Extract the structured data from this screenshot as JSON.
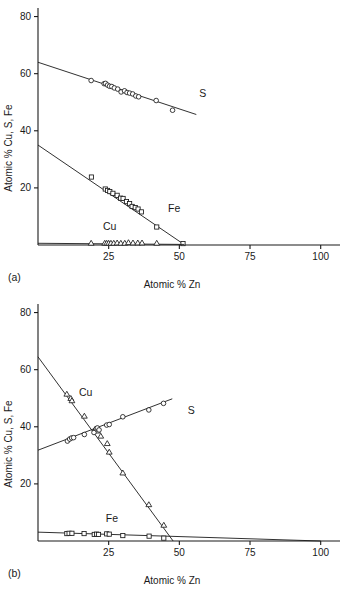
{
  "figure": {
    "panels": [
      {
        "id": "a",
        "panel_label": "(a)",
        "xlabel": "Atomic % Zn",
        "ylabel": "Atomic % Cu, S, Fe"
      },
      {
        "id": "b",
        "panel_label": "(b)",
        "xlabel": "Atomic % Zn",
        "ylabel": "Atomic % Cu, S, Fe"
      }
    ]
  },
  "chart_data": [
    {
      "type": "scatter",
      "panel": "(a)",
      "title": "",
      "xlabel": "Atomic % Zn",
      "ylabel": "Atomic % Cu, S, Fe",
      "xlim": [
        0,
        104
      ],
      "ylim": [
        0,
        83
      ],
      "xticks": [
        25,
        50,
        75,
        100
      ],
      "xtick_labels": [
        "25",
        "50",
        "75",
        "100"
      ],
      "yticks": [
        20,
        40,
        60,
        80
      ],
      "ytick_labels": [
        "20",
        "40",
        "60",
        "80"
      ],
      "grid": false,
      "legend": "inline-labels",
      "series": [
        {
          "name": "S",
          "label": "S",
          "marker": "circle",
          "label_x": 57,
          "label_y": 52,
          "trend_line": {
            "x1": 0,
            "y1": 64.0,
            "x2": 56,
            "y2": 45.7
          },
          "points": [
            {
              "x": 18.8,
              "y": 57.6
            },
            {
              "x": 23.4,
              "y": 56.5
            },
            {
              "x": 23.9,
              "y": 56.6
            },
            {
              "x": 24.6,
              "y": 56.0
            },
            {
              "x": 25.3,
              "y": 55.6
            },
            {
              "x": 26.1,
              "y": 55.5
            },
            {
              "x": 27.0,
              "y": 55.0
            },
            {
              "x": 28.2,
              "y": 54.6
            },
            {
              "x": 29.4,
              "y": 53.6
            },
            {
              "x": 30.6,
              "y": 54.0
            },
            {
              "x": 31.5,
              "y": 53.4
            },
            {
              "x": 32.4,
              "y": 53.2
            },
            {
              "x": 33.5,
              "y": 52.9
            },
            {
              "x": 34.6,
              "y": 52.2
            },
            {
              "x": 35.6,
              "y": 51.9
            },
            {
              "x": 41.8,
              "y": 50.6
            },
            {
              "x": 47.6,
              "y": 47.2
            }
          ]
        },
        {
          "name": "Fe",
          "label": "Fe",
          "marker": "square",
          "label_x": 46,
          "label_y": 11.5,
          "trend_line": {
            "x1": 0,
            "y1": 35.0,
            "x2": 51.5,
            "y2": 0.3
          },
          "points": [
            {
              "x": 18.9,
              "y": 23.8
            },
            {
              "x": 23.8,
              "y": 19.6
            },
            {
              "x": 24.6,
              "y": 19.1
            },
            {
              "x": 25.4,
              "y": 18.7
            },
            {
              "x": 26.5,
              "y": 18.1
            },
            {
              "x": 28.0,
              "y": 17.4
            },
            {
              "x": 29.2,
              "y": 16.4
            },
            {
              "x": 30.1,
              "y": 16.3
            },
            {
              "x": 31.3,
              "y": 15.2
            },
            {
              "x": 32.4,
              "y": 14.5
            },
            {
              "x": 33.3,
              "y": 13.5
            },
            {
              "x": 34.4,
              "y": 13.1
            },
            {
              "x": 35.4,
              "y": 12.6
            },
            {
              "x": 36.6,
              "y": 11.6
            },
            {
              "x": 42.0,
              "y": 6.3
            },
            {
              "x": 51.3,
              "y": 0.5
            }
          ]
        },
        {
          "name": "Cu",
          "label": "Cu",
          "marker": "triangle",
          "label_x": 23,
          "label_y": 5.2,
          "trend_line": {
            "x1": 0,
            "y1": 0.6,
            "x2": 51.8,
            "y2": 0.2
          },
          "points": [
            {
              "x": 18.8,
              "y": 0.7
            },
            {
              "x": 23.6,
              "y": 0.7
            },
            {
              "x": 24.3,
              "y": 0.7
            },
            {
              "x": 25.0,
              "y": 0.7
            },
            {
              "x": 25.8,
              "y": 0.7
            },
            {
              "x": 26.8,
              "y": 0.7
            },
            {
              "x": 28.0,
              "y": 0.8
            },
            {
              "x": 29.3,
              "y": 0.7
            },
            {
              "x": 30.7,
              "y": 0.7
            },
            {
              "x": 32.0,
              "y": 0.9
            },
            {
              "x": 33.6,
              "y": 0.8
            },
            {
              "x": 35.3,
              "y": 0.8
            },
            {
              "x": 36.8,
              "y": 0.8
            },
            {
              "x": 42.0,
              "y": 0.7
            }
          ]
        }
      ]
    },
    {
      "type": "scatter",
      "panel": "(b)",
      "title": "",
      "xlabel": "Atomic % Zn",
      "ylabel": "Atomic % Cu, S, Fe",
      "xlim": [
        0,
        104
      ],
      "ylim": [
        0,
        83
      ],
      "xticks": [
        25,
        50,
        75,
        100
      ],
      "xtick_labels": [
        "25",
        "50",
        "75",
        "100"
      ],
      "yticks": [
        20,
        40,
        60,
        80
      ],
      "ytick_labels": [
        "20",
        "40",
        "60",
        "80"
      ],
      "grid": false,
      "legend": "inline-labels",
      "series": [
        {
          "name": "Cu",
          "label": "Cu",
          "marker": "triangle",
          "label_x": 14.5,
          "label_y": 50.8,
          "trend_line": {
            "x1": 0,
            "y1": 64.5,
            "x2": 47.8,
            "y2": 0.0
          },
          "points": [
            {
              "x": 10.2,
              "y": 51.5
            },
            {
              "x": 11.6,
              "y": 50.0
            },
            {
              "x": 12.0,
              "y": 49.2
            },
            {
              "x": 16.4,
              "y": 43.8
            },
            {
              "x": 20.3,
              "y": 39.3
            },
            {
              "x": 21.0,
              "y": 38.6
            },
            {
              "x": 22.2,
              "y": 36.8
            },
            {
              "x": 24.5,
              "y": 34.2
            },
            {
              "x": 25.2,
              "y": 31.2
            },
            {
              "x": 30.0,
              "y": 23.9
            },
            {
              "x": 39.2,
              "y": 12.8
            },
            {
              "x": 44.5,
              "y": 5.6
            }
          ]
        },
        {
          "name": "S",
          "label": "S",
          "marker": "circle",
          "label_x": 53,
          "label_y": 44.5,
          "trend_line": {
            "x1": 0,
            "y1": 31.8,
            "x2": 47.5,
            "y2": 49.8
          },
          "points": [
            {
              "x": 10.4,
              "y": 35.0
            },
            {
              "x": 11.2,
              "y": 35.7
            },
            {
              "x": 11.9,
              "y": 36.1
            },
            {
              "x": 12.6,
              "y": 36.2
            },
            {
              "x": 16.4,
              "y": 37.3
            },
            {
              "x": 19.8,
              "y": 38.0
            },
            {
              "x": 20.6,
              "y": 39.3
            },
            {
              "x": 21.0,
              "y": 39.6
            },
            {
              "x": 21.6,
              "y": 38.9
            },
            {
              "x": 24.3,
              "y": 40.6
            },
            {
              "x": 25.2,
              "y": 40.8
            },
            {
              "x": 30.0,
              "y": 43.5
            },
            {
              "x": 39.2,
              "y": 45.9
            },
            {
              "x": 44.4,
              "y": 48.2
            }
          ]
        },
        {
          "name": "Fe",
          "label": "Fe",
          "marker": "square",
          "label_x": 24,
          "label_y": 6.8,
          "trend_line": {
            "x1": 0,
            "y1": 3.1,
            "x2": 100,
            "y2": 0.0
          },
          "points": [
            {
              "x": 10.2,
              "y": 2.6
            },
            {
              "x": 11.0,
              "y": 2.7
            },
            {
              "x": 12.0,
              "y": 2.7
            },
            {
              "x": 16.3,
              "y": 2.6
            },
            {
              "x": 19.9,
              "y": 2.3
            },
            {
              "x": 20.7,
              "y": 2.4
            },
            {
              "x": 21.4,
              "y": 2.3
            },
            {
              "x": 24.3,
              "y": 2.5
            },
            {
              "x": 25.2,
              "y": 2.4
            },
            {
              "x": 30.0,
              "y": 1.9
            },
            {
              "x": 39.3,
              "y": 1.7
            },
            {
              "x": 44.5,
              "y": 1.0
            }
          ]
        }
      ]
    }
  ]
}
